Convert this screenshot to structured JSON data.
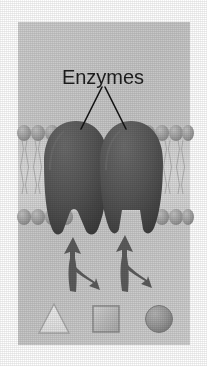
{
  "figure": {
    "panel": {
      "x": 18,
      "y": 22,
      "width": 172,
      "height": 323,
      "background_color": "#c9c9c9",
      "page_background_color": "#ffffff"
    },
    "label": {
      "text": "Enzymes",
      "color": "#1d1d1d",
      "x": 103,
      "y": 77,
      "font_size": 20
    },
    "leader_lines": {
      "color": "#111111",
      "from": [
        103,
        86
      ],
      "to_left": [
        79,
        128
      ],
      "to_right": [
        127,
        128
      ]
    },
    "membrane": {
      "name": "phospholipid-bilayer",
      "head_color": "#9d9d9d",
      "head_highlight_color": "#bcbcbc",
      "tail_color": "#b9b9b9",
      "interior_color": "#d6d6d6",
      "top_heads_y": 134,
      "bottom_heads_y": 216,
      "head_radius_x": 7,
      "head_radius_y": 8,
      "head_count": 13
    },
    "enzymes": [
      {
        "name": "enzyme-left",
        "color": "#4f4f4f",
        "highlight_color": "#6e6e6e",
        "shadow_color": "#3a3a3a",
        "center_x": 76,
        "top_y": 122,
        "bottom_y": 232,
        "width": 66,
        "notch_shape": "triangle",
        "notch_width": 17,
        "notch_depth": 20
      },
      {
        "name": "enzyme-right",
        "color": "#4f4f4f",
        "highlight_color": "#6e6e6e",
        "shadow_color": "#3a3a3a",
        "center_x": 131,
        "top_y": 122,
        "bottom_y": 232,
        "width": 64,
        "notch_shape": "square",
        "notch_width": 18,
        "notch_depth": 20
      }
    ],
    "arrows": [
      {
        "name": "reaction-arrow-left",
        "color": "#5b5b5b",
        "shaft_bottom": [
          62,
          290
        ],
        "tip_up": [
          73,
          238
        ],
        "tip_branch": [
          97,
          284
        ],
        "direction": "up-and-branch-down-right"
      },
      {
        "name": "reaction-arrow-right",
        "color": "#5b5b5b",
        "shaft_bottom": [
          117,
          290
        ],
        "tip_up": [
          125,
          236
        ],
        "tip_branch": [
          149,
          284
        ],
        "direction": "up-and-branch-down-right"
      }
    ],
    "substrates": [
      {
        "name": "substrate-triangle",
        "shape": "triangle",
        "fill_color": "#e8e8e8",
        "stroke_color": "#a0a0a0",
        "center_x": 54,
        "center_y": 320,
        "size": 30
      },
      {
        "name": "substrate-square",
        "shape": "square",
        "fill_color": "#bdbdbd",
        "stroke_color": "#8c8c8c",
        "center_x": 106,
        "center_y": 319,
        "size": 26
      },
      {
        "name": "substrate-circle",
        "shape": "circle",
        "fill_color": "#9a9a9a",
        "stroke_color": "#7b7b7b",
        "center_x": 159,
        "center_y": 319,
        "size": 27
      }
    ]
  }
}
